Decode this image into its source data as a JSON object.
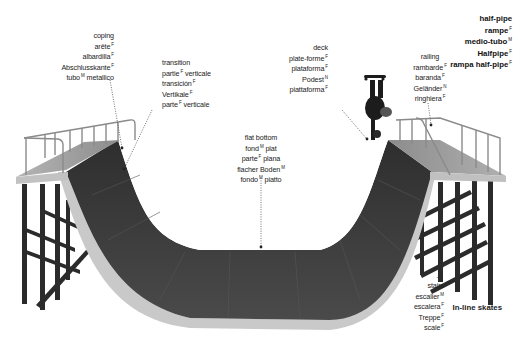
{
  "page": {
    "title_terms": [
      {
        "text": "half-pipe",
        "gender": ""
      },
      {
        "text": "rampe",
        "gender": "F"
      },
      {
        "text": "medio-tubo",
        "gender": "M"
      },
      {
        "text": "Halfpipe",
        "gender": "F"
      },
      {
        "text": "rampa half-pipe",
        "gender": "F"
      }
    ],
    "footer": "In-line skates"
  },
  "labels": {
    "coping": [
      {
        "text": "coping",
        "gender": ""
      },
      {
        "text": "arête",
        "gender": "F"
      },
      {
        "text": "albardilla",
        "gender": "F"
      },
      {
        "text": "Abschlusskante",
        "gender": "F"
      },
      {
        "text": "tubo",
        "gender": "M",
        "suffix": "metallico"
      }
    ],
    "transition": [
      {
        "text": "transition",
        "gender": ""
      },
      {
        "text": "partie",
        "gender": "F",
        "suffix": "verticale"
      },
      {
        "text": "transición",
        "gender": "F"
      },
      {
        "text": "Vertikale",
        "gender": "F"
      },
      {
        "text": "parte",
        "gender": "F",
        "suffix": "verticale"
      }
    ],
    "flat_bottom": [
      {
        "text": "flat bottom",
        "gender": ""
      },
      {
        "text": "fond",
        "gender": "M",
        "suffix": "plat"
      },
      {
        "text": "parte",
        "gender": "F",
        "suffix": "plana"
      },
      {
        "text": "flacher Boden",
        "gender": "M"
      },
      {
        "text": "fondo",
        "gender": "M",
        "suffix": "piatto"
      }
    ],
    "deck": [
      {
        "text": "deck",
        "gender": ""
      },
      {
        "text": "plate-forme",
        "gender": "F"
      },
      {
        "text": "plataforma",
        "gender": "F"
      },
      {
        "text": "Podest",
        "gender": "N"
      },
      {
        "text": "piattaforma",
        "gender": "F"
      }
    ],
    "railing": [
      {
        "text": "railing",
        "gender": ""
      },
      {
        "text": "rambarde",
        "gender": "F"
      },
      {
        "text": "baranda",
        "gender": "F"
      },
      {
        "text": "Geländer",
        "gender": "N"
      },
      {
        "text": "ringhiera",
        "gender": "F"
      }
    ],
    "stairs": [
      {
        "text": "stairs",
        "gender": ""
      },
      {
        "text": "escalier",
        "gender": "M"
      },
      {
        "text": "escalera",
        "gender": "F"
      },
      {
        "text": "Treppe",
        "gender": "F"
      },
      {
        "text": "scale",
        "gender": "F"
      }
    ]
  },
  "colors": {
    "ramp_surface": "#3a3a3a",
    "ramp_edge": "#c8c8c8",
    "deck": "#9a9a9a",
    "frame": "#2a2a2a",
    "rail": "#8a8a8a",
    "leader": "#333333"
  }
}
